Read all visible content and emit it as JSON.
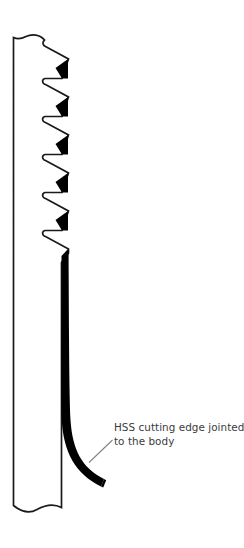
{
  "figure": {
    "name": "saw-blade-cross-section-diagram",
    "type": "technical-line-drawing",
    "background_color": "#ffffff",
    "width": 244,
    "height": 548
  },
  "annotation": {
    "line_1": "HSS cutting edge jointed",
    "line_2": "to the body",
    "text_color": "#3b3b3d",
    "leader_line_color": "#808083"
  },
  "blade": {
    "outline_color": "#1a1a1a",
    "outline_width": 1.6,
    "fill_color": "#ffffff",
    "cutting_edge_color": "#000000",
    "tooth_count": 6,
    "body_left_x": 13,
    "body_right_x": 62,
    "teeth_tip_x": 68,
    "tooth_pitch": 38,
    "first_tooth_y": 64,
    "top_break_y": 36,
    "bottom_break_y": 505,
    "cutting_edge_top_y": 262,
    "cutting_edge_curve_end_x": 105,
    "cutting_edge_curve_end_y": 483
  }
}
